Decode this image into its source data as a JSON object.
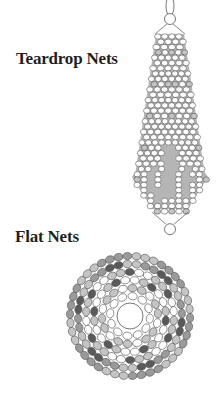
{
  "sections": [
    {
      "title": "Teardrop Nets",
      "illustration": "teardrop-net-beadwork-illustration"
    },
    {
      "title": "Flat Nets",
      "illustration": "flat-net-circular-beadwork-illustration"
    }
  ],
  "colors": {
    "background": "#ffffff",
    "text": "#1f1f1f",
    "bead_outline": "#555555",
    "bead_white": "#ffffff",
    "bead_light_gray": "#c4c4c4",
    "bead_mid_gray": "#9a9a9a",
    "bead_dark_gray": "#5a5a5a"
  }
}
